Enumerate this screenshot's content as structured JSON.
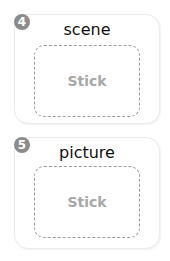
{
  "cards": [
    {
      "number": "4",
      "word": "scene",
      "placeholder": "Stick"
    },
    {
      "number": "5",
      "word": "picture",
      "placeholder": "Stick"
    }
  ]
}
